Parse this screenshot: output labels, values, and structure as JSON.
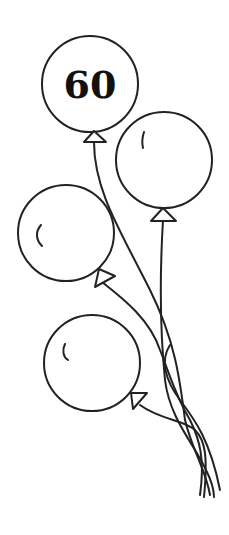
{
  "illustration": {
    "title": "Bunch of balloons",
    "balloons": [
      {
        "id": "top",
        "label": "60"
      },
      {
        "id": "upper-right",
        "label": ""
      },
      {
        "id": "middle-left",
        "label": ""
      },
      {
        "id": "lower",
        "label": ""
      }
    ],
    "colors": {
      "stroke": "#222222",
      "fill": "#ffffff",
      "background": "#ffffff"
    }
  }
}
